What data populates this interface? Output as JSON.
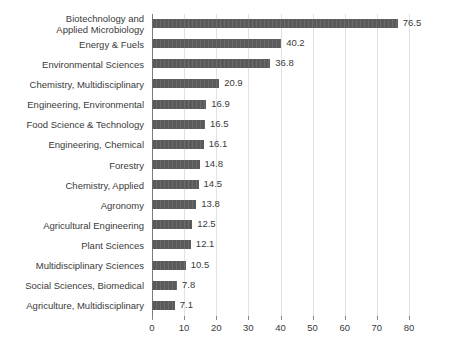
{
  "chart_data": {
    "type": "bar",
    "orientation": "horizontal",
    "title": "",
    "subtitle": "",
    "xlabel": "",
    "ylabel": "",
    "xlim": [
      0,
      80
    ],
    "xticks": [
      0,
      10,
      20,
      30,
      40,
      50,
      60,
      70,
      80
    ],
    "grid": true,
    "legend": false,
    "bar_color": "#5a5a5a",
    "text_color": "#3a3a3a",
    "gridline_color": "#e2e2e2",
    "axis_color": "#7a7a7a",
    "categories": [
      "Biotechnology and Applied Microbiology",
      "Energy & Fuels",
      "Environmental Sciences",
      "Chemistry, Multidisciplinary",
      "Engineering, Environmental",
      "Food Science & Technology",
      "Engineering, Chemical",
      "Forestry",
      "Chemistry, Applied",
      "Agronomy",
      "Agricultural Engineering",
      "Plant Sciences",
      "Multidisciplinary Sciences",
      "Social Sciences, Biomedical",
      "Agriculture, Multidisciplinary"
    ],
    "category_lines": [
      [
        "Biotechnology and",
        "Applied Microbiology"
      ],
      [
        "Energy & Fuels"
      ],
      [
        "Environmental Sciences"
      ],
      [
        "Chemistry, Multidisciplinary"
      ],
      [
        "Engineering, Environmental"
      ],
      [
        "Food Science & Technology"
      ],
      [
        "Engineering, Chemical"
      ],
      [
        "Forestry"
      ],
      [
        "Chemistry, Applied"
      ],
      [
        "Agronomy"
      ],
      [
        "Agricultural Engineering"
      ],
      [
        "Plant Sciences"
      ],
      [
        "Multidisciplinary Sciences"
      ],
      [
        "Social Sciences, Biomedical"
      ],
      [
        "Agriculture, Multidisciplinary"
      ]
    ],
    "values": [
      76.5,
      40.2,
      36.8,
      20.9,
      16.9,
      16.5,
      16.1,
      14.8,
      14.5,
      13.8,
      12.5,
      12.1,
      10.5,
      7.8,
      7.1
    ],
    "value_labels": [
      "76.5",
      "40.2",
      "36.8",
      "20.9",
      "16.9",
      "16.5",
      "16.1",
      "14.8",
      "14.5",
      "13.8",
      "12.5",
      "12.1",
      "10.5",
      "7.8",
      "7.1"
    ],
    "tick_labels": [
      "0",
      "10",
      "20",
      "30",
      "40",
      "50",
      "60",
      "70",
      "80"
    ]
  }
}
